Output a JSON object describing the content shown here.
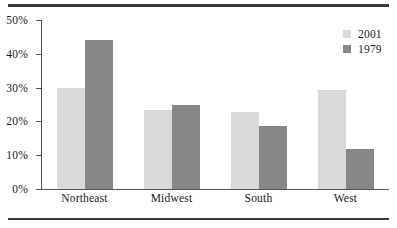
{
  "chart_data": {
    "type": "bar",
    "title": "",
    "subtitle": "",
    "xlabel": "",
    "ylabel": "",
    "categories": [
      "Northeast",
      "Midwest",
      "South",
      "West"
    ],
    "series": [
      {
        "name": "2001",
        "color": "#d9d9d9",
        "values": [
          30.0,
          23.4,
          22.8,
          29.3
        ]
      },
      {
        "name": "1979",
        "color": "#878787",
        "values": [
          44.2,
          24.8,
          18.6,
          11.8
        ]
      }
    ],
    "ylim": [
      0,
      50
    ],
    "y_ticks": [
      0,
      10,
      20,
      30,
      40,
      50
    ],
    "y_tick_labels": [
      "0%",
      "10%",
      "20%",
      "30%",
      "40%",
      "50%"
    ],
    "grid": false,
    "legend_position": "top-right",
    "annotations": []
  },
  "axis": {
    "y_labels": [
      "50%",
      "40%",
      "30%",
      "20%",
      "10%",
      "0%"
    ]
  },
  "legend": {
    "entries": [
      {
        "label": "2001",
        "color": "#d9d9d9"
      },
      {
        "label": "1979",
        "color": "#878787"
      }
    ]
  },
  "categories": {
    "items": [
      "Northeast",
      "Midwest",
      "South",
      "West"
    ]
  }
}
